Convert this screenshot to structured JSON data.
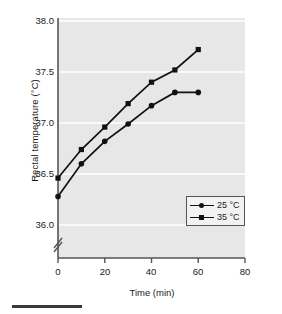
{
  "chart_data": {
    "type": "line",
    "title": "",
    "xlabel": "Time (min)",
    "ylabel": "Rectal temperature (°C)",
    "x": [
      0,
      10,
      20,
      30,
      40,
      50,
      60
    ],
    "xlim": [
      0,
      80
    ],
    "ylim": [
      36.0,
      38.0
    ],
    "xticks": [
      "0",
      "20",
      "40",
      "60",
      "80"
    ],
    "xtick_values": [
      0,
      20,
      40,
      60,
      80
    ],
    "yticks": [
      "36.0",
      "36.5",
      "37.0",
      "37.5",
      "38.0"
    ],
    "ytick_values": [
      36.0,
      36.5,
      37.0,
      37.5,
      38.0
    ],
    "y_axis_break": true,
    "grid": "horizontal-white",
    "plot_background": "#e7e7e7",
    "legend_position": "bottom-right",
    "series": [
      {
        "name": "25 °C",
        "marker": "circle",
        "color": "#111111",
        "values": [
          36.28,
          36.6,
          36.82,
          36.99,
          37.17,
          37.3,
          37.3
        ]
      },
      {
        "name": "35 °C",
        "marker": "square",
        "color": "#111111",
        "values": [
          36.46,
          36.74,
          36.96,
          37.19,
          37.4,
          37.52,
          37.72
        ]
      }
    ]
  },
  "legend": {
    "items": [
      {
        "label": "25 °C",
        "marker": "circle"
      },
      {
        "label": "35 °C",
        "marker": "square"
      }
    ]
  }
}
